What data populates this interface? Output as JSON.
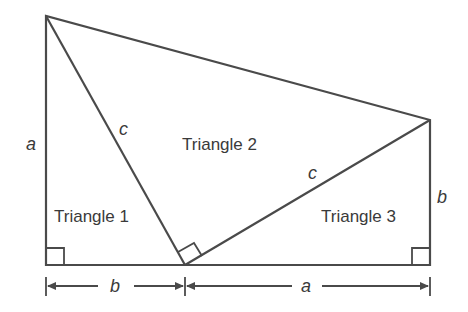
{
  "diagram": {
    "triangles": [
      {
        "label": "Triangle 1"
      },
      {
        "label": "Triangle 2"
      },
      {
        "label": "Triangle 3"
      }
    ],
    "side_labels": {
      "left_vertical": "a",
      "hyp_left": "c",
      "hyp_right": "c",
      "right_vertical": "b",
      "bottom_left_dim": "b",
      "bottom_right_dim": "a"
    },
    "colors": {
      "stroke": "#4a4a4a",
      "text": "#3a3a3a",
      "background": "#ffffff"
    }
  }
}
